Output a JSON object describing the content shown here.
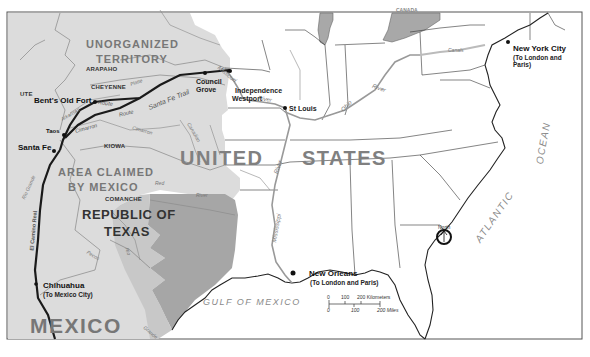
{
  "map": {
    "regions": {
      "unorganized_territory_1": "UNORGANIZED",
      "unorganized_territory_2": "TERRITORY",
      "united_states_1": "UNITED",
      "united_states_2": "STATES",
      "area_claimed_1": "AREA CLAIMED",
      "area_claimed_2": "BY MEXICO",
      "republic_texas_1": "REPUBLIC OF",
      "republic_texas_2": "TEXAS",
      "mexico": "MEXICO",
      "canada": "CANADA"
    },
    "tribes": [
      "ARAPAHO",
      "CHEYENNE",
      "UTE",
      "KIOWA",
      "COMANCHE"
    ],
    "cities": {
      "bents_old_fort": "Bent's Old Fort",
      "taos": "Taos",
      "santa_fe": "Santa Fe",
      "council_grove_1": "Council",
      "council_grove_2": "Grove",
      "independence": "Independence",
      "westport": "Westport",
      "st_louis": "St Louis",
      "new_york": "New York City",
      "new_york_note_1": "(To London and",
      "new_york_note_2": "Paris)",
      "new_orleans": "New Orleans",
      "new_orleans_note": "(To London and Paris)",
      "chihuahua": "Chihuahua",
      "chihuahua_note": "(To Mexico City)"
    },
    "trails": {
      "santa_fe_trail": "Santa Fe Trail",
      "el_camino_real": "El Camino Real",
      "cimarron": "Cimarron",
      "route_1": "Route",
      "route_2": "Route"
    },
    "rivers": {
      "missouri": "Missouri",
      "missouri_river": "River",
      "ohio": "Ohio",
      "ohio_river": "River",
      "mississippi": "Mississippi",
      "mississippi_river": "River",
      "rio_grande_1": "Rio Grande",
      "rio_grande_2": "Rio",
      "rio_grande_3": "Grande",
      "platte": "Platte",
      "arkansas": "Arkansas",
      "cimarron_river": "Cimarron",
      "canadian": "Canadian",
      "red": "Red",
      "red_river": "River",
      "pecos": "Pecos",
      "canals": "Canals"
    },
    "water_bodies": {
      "gulf_of_mexico": "GULF   OF   MEXICO",
      "atlantic": "ATLANTIC",
      "ocean": "OCEAN"
    },
    "north_arrow": {
      "label": "North",
      "icon": "north-arrow-icon"
    },
    "scale_bar": {
      "km_ticks": [
        "0",
        "100",
        "200 Kilometers"
      ],
      "mile_ticks": [
        "0",
        "100",
        "200 Miles"
      ]
    },
    "colors": {
      "mexican_territory": "#d9d9d9",
      "texas": "#a6a6a6",
      "lakes": "#a8a8a8",
      "land": "#ffffff",
      "border": "#222222",
      "river": "#9a9a9a",
      "trail": "#1a1a1a"
    }
  }
}
